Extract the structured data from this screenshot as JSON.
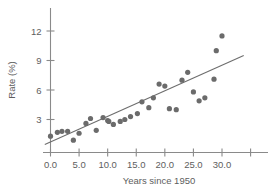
{
  "chart_data": {
    "type": "scatter",
    "title": "",
    "xlabel": "Years since 1950",
    "ylabel": "Rate (%)",
    "xlim": [
      -1.5,
      35.5
    ],
    "ylim": [
      0.0,
      13.0
    ],
    "grid": false,
    "legend": null,
    "xticks": [
      {
        "value": 0.0,
        "label": "0.0"
      },
      {
        "value": 5.0,
        "label": "5.0"
      },
      {
        "value": 10.0,
        "label": "10.0"
      },
      {
        "value": 15.0,
        "label": "15.0"
      },
      {
        "value": 20.0,
        "label": "20.0"
      },
      {
        "value": 25.0,
        "label": "25.0"
      },
      {
        "value": 30.0,
        "label": "30.0"
      },
      {
        "value": 35.0,
        "label": ""
      }
    ],
    "yticks": [
      {
        "value": 3,
        "label": "3"
      },
      {
        "value": 6,
        "label": "6"
      },
      {
        "value": 9,
        "label": "9"
      },
      {
        "value": 12,
        "label": "12"
      }
    ],
    "points": [
      {
        "x": 0.0,
        "y": 1.3
      },
      {
        "x": 1.2,
        "y": 1.7
      },
      {
        "x": 2.0,
        "y": 1.8
      },
      {
        "x": 3.0,
        "y": 1.8
      },
      {
        "x": 4.0,
        "y": 0.9
      },
      {
        "x": 5.0,
        "y": 1.6
      },
      {
        "x": 6.2,
        "y": 2.6
      },
      {
        "x": 7.0,
        "y": 3.1
      },
      {
        "x": 8.0,
        "y": 1.9
      },
      {
        "x": 9.2,
        "y": 3.2
      },
      {
        "x": 10.0,
        "y": 2.9
      },
      {
        "x": 10.2,
        "y": 2.8
      },
      {
        "x": 11.0,
        "y": 2.5
      },
      {
        "x": 12.2,
        "y": 2.8
      },
      {
        "x": 13.0,
        "y": 3.0
      },
      {
        "x": 14.0,
        "y": 3.3
      },
      {
        "x": 15.2,
        "y": 3.6
      },
      {
        "x": 16.0,
        "y": 4.8
      },
      {
        "x": 17.2,
        "y": 4.2
      },
      {
        "x": 18.0,
        "y": 5.2
      },
      {
        "x": 19.0,
        "y": 6.6
      },
      {
        "x": 20.0,
        "y": 6.4
      },
      {
        "x": 20.8,
        "y": 4.1
      },
      {
        "x": 22.0,
        "y": 4.0
      },
      {
        "x": 23.0,
        "y": 7.0
      },
      {
        "x": 24.0,
        "y": 7.8
      },
      {
        "x": 25.0,
        "y": 5.8
      },
      {
        "x": 26.0,
        "y": 4.9
      },
      {
        "x": 27.0,
        "y": 5.2
      },
      {
        "x": 28.6,
        "y": 7.1
      },
      {
        "x": 29.0,
        "y": 10.0
      },
      {
        "x": 30.0,
        "y": 11.5
      }
    ],
    "fit_line": {
      "type": "linear-regression",
      "x_start": -1.0,
      "y_start": 0.45,
      "x_end": 33.8,
      "y_end": 9.5
    },
    "colors": {
      "point": "#6b6b6b",
      "line": "#6d6d6d",
      "axis": "#8a8a8a",
      "text": "#5e5e5e",
      "background": "#ffffff"
    }
  }
}
